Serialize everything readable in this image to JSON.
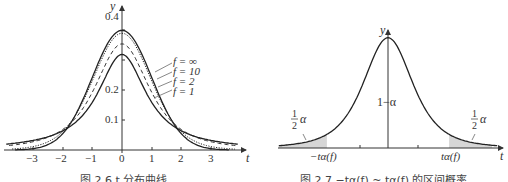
{
  "chart_data": [
    {
      "type": "line",
      "title": "图 2.6  t 分布曲线",
      "xlabel": "t",
      "ylabel": "y",
      "x_ticks": [
        -3,
        -2,
        -1,
        0,
        1,
        2,
        3
      ],
      "y_ticks": [
        0.1,
        0.2,
        0.4
      ],
      "xlim": [
        -3.7,
        3.9
      ],
      "ylim": [
        0,
        0.42
      ],
      "grid": false,
      "legend_position": "annotations right of peak",
      "series": [
        {
          "name": "f=∞",
          "style": "solid",
          "peak": 0.399
        },
        {
          "name": "f=10",
          "style": "dotted",
          "peak": 0.389
        },
        {
          "name": "f=2",
          "style": "dashed",
          "peak": 0.354
        },
        {
          "name": "f=1",
          "style": "solid",
          "peak": 0.318
        }
      ]
    },
    {
      "type": "area",
      "title": "图 2.7  −tα(f) ~ tα(f) 的区间概率",
      "xlabel": "t",
      "ylabel": "y",
      "x_tick_labels": [
        "−tα(f)",
        "tα(f)"
      ],
      "grid": false,
      "annotations": [
        "1−α",
        "½α",
        "½α"
      ],
      "shaded_regions": [
        "t < −tα(f)",
        "t > tα(f)"
      ]
    }
  ],
  "left": {
    "y_label": "y",
    "x_label": "t",
    "y_ticks": [
      "0.4",
      "0.2",
      "0.1"
    ],
    "x_ticks": [
      "−3",
      "−2",
      "−1",
      "0",
      "1",
      "2",
      "3"
    ],
    "legend": [
      "f = ∞",
      "f = 10",
      "f = 2",
      "f = 1"
    ],
    "caption": "图 2.6  t 分布曲线"
  },
  "right": {
    "y_label": "y",
    "x_label": "t",
    "center_label": "1−α",
    "tail_num": "1",
    "tail_den": "2",
    "tail_alpha": "α",
    "left_crit": "−tα(f)",
    "right_crit": "tα(f)",
    "caption": "图 2.7  −tα(f) ~ tα(f) 的区间概率"
  }
}
